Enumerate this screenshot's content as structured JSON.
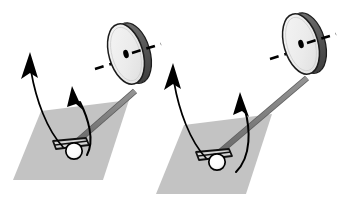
{
  "figure": {
    "type": "physics-diagram",
    "panel_count": 2,
    "background_color": "#ffffff",
    "has_text_labels": false,
    "caption": "",
    "title": ""
  },
  "palette": {
    "ground_fill": "#c3c3c3",
    "ground_stroke": "none",
    "axle_rod": "#808080",
    "axle_rod_outline": "#4d4d4d",
    "wheel_face": "#ededed",
    "wheel_face_highlight": "#f7f7f7",
    "wheel_rim": "#5a5a5a",
    "wheel_outline": "#1a1a1a",
    "hub_dot": "#000000",
    "dashed_axis": "#000000",
    "arrow": "#000000",
    "pivot_ball_fill": "#ffffff",
    "pivot_ball_stroke": "#000000",
    "pivot_bracket": "#1a1a1a"
  },
  "panels": [
    {
      "id": "panel-left",
      "name": "left-gyroscope",
      "ground_plane": {
        "name": "ground-plane-left",
        "points": "41,111 129,100 103,180 13,180",
        "fill": "#c3c3c3"
      },
      "pivot": {
        "name": "pivot-left",
        "ball_cx": 74,
        "ball_cy": 151,
        "ball_r": 8.2,
        "bracket_points": "54,142 85,139 88,146 57,150"
      },
      "axle": {
        "name": "axle-rod-left",
        "x1": 72,
        "y1": 146,
        "x2": 135,
        "y2": 91,
        "width": 4.6,
        "color": "#808080"
      },
      "wheel": {
        "name": "wheel-left",
        "cx": 126,
        "cy": 54,
        "rx": 17,
        "ry": 31,
        "rotation": -16,
        "rim_offset_x": 7,
        "rim_offset_y": 1,
        "hub_r": 3.4,
        "face_color": "#ededed",
        "rim_color": "#5a5a5a"
      },
      "spin_axis": {
        "name": "spin-axis-left",
        "x1": 96,
        "y1": 68,
        "x2": 160,
        "y2": 49,
        "dash": "9 6",
        "width": 2.6
      },
      "arrows": [
        {
          "name": "angular-momentum-arrow-left",
          "kind": "curved",
          "path": "M 63,147 C 47,130 36,100 31,71",
          "head_x": 29,
          "head_y": 58,
          "head_angle": -80,
          "stroke_width": 1.7
        },
        {
          "name": "torque-arrow-left",
          "kind": "curved",
          "path": "M 87,155 C 95,140 88,118 80,102",
          "head_x": 75,
          "head_y": 92,
          "head_angle": -62,
          "stroke_width": 2.0
        }
      ]
    },
    {
      "id": "panel-right",
      "name": "right-gyroscope",
      "ground_plane": {
        "name": "ground-plane-right",
        "points": "184,125 272,114 246,194 156,194",
        "fill": "#c3c3c3"
      },
      "pivot": {
        "name": "pivot-right",
        "ball_cx": 217,
        "ball_cy": 162,
        "ball_r": 8.2,
        "bracket_points": "197,153 228,150 231,157 200,161"
      },
      "axle": {
        "name": "axle-rod-right",
        "x1": 214,
        "y1": 157,
        "x2": 307,
        "y2": 78,
        "width": 4.6,
        "color": "#808080"
      },
      "wheel": {
        "name": "wheel-right",
        "cx": 301,
        "cy": 44,
        "rx": 17,
        "ry": 31,
        "rotation": -16,
        "rim_offset_x": 7,
        "rim_offset_y": 1,
        "hub_r": 3.4,
        "face_color": "#ededed",
        "rim_color": "#5a5a5a"
      },
      "spin_axis": {
        "name": "spin-axis-right",
        "x1": 271,
        "y1": 58,
        "x2": 335,
        "y2": 39,
        "dash": "9 6",
        "width": 2.6
      },
      "arrows": [
        {
          "name": "angular-momentum-arrow-right",
          "kind": "curved",
          "path": "M 206,158 C 190,141 179,111 174,82",
          "head_x": 172,
          "head_y": 69,
          "head_angle": -80,
          "stroke_width": 1.7
        },
        {
          "name": "torque-arrow-right",
          "kind": "curved",
          "path": "M 236,172 C 252,156 250,128 245,110",
          "head_x": 242,
          "head_y": 99,
          "head_angle": -70,
          "stroke_width": 2.0
        }
      ]
    }
  ]
}
